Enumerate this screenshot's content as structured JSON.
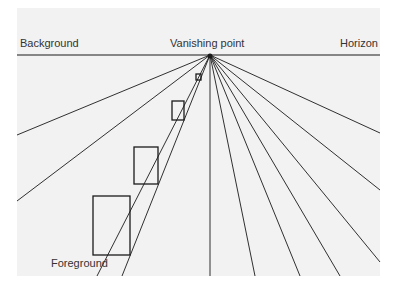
{
  "diagram": {
    "labels": {
      "background": "Background",
      "vanishing_point": "Vanishing point",
      "horizon": "Horizon",
      "foreground": "Foreground"
    },
    "colors": {
      "panel": "#f2f2f2",
      "ink": "#1a1a1a",
      "text": "#333333"
    },
    "vanishing_point": [
      210,
      55
    ],
    "horizon_y": 55,
    "rays_end": [
      [
        17,
        135
      ],
      [
        17,
        201
      ],
      [
        97,
        276
      ],
      [
        122,
        276
      ],
      [
        210,
        276
      ],
      [
        300,
        276
      ],
      [
        380,
        262
      ],
      [
        380,
        190
      ],
      [
        380,
        133
      ],
      [
        340,
        276
      ],
      [
        255,
        276
      ]
    ],
    "rectangles": [
      {
        "x": 196,
        "y": 74,
        "w": 5,
        "h": 6
      },
      {
        "x": 172,
        "y": 101,
        "w": 12,
        "h": 19
      },
      {
        "x": 134,
        "y": 147,
        "w": 24,
        "h": 37
      },
      {
        "x": 93,
        "y": 196,
        "w": 37,
        "h": 59
      }
    ]
  }
}
